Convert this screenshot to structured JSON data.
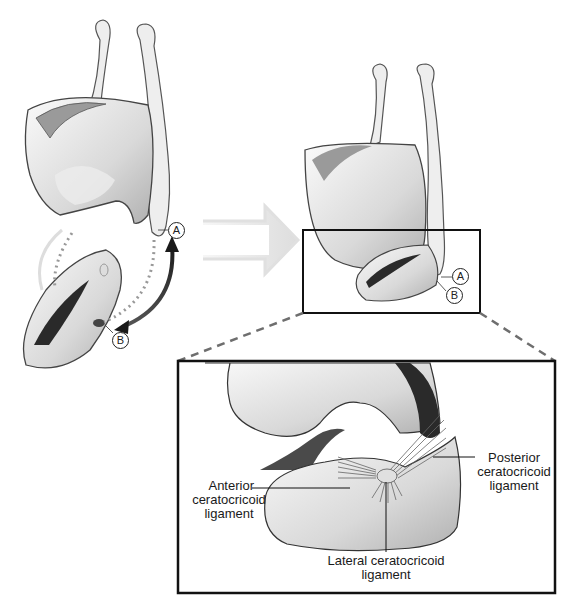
{
  "diagram": {
    "type": "anatomical illustration",
    "left_figure": {
      "markers": [
        {
          "id": "A",
          "label": "A"
        },
        {
          "id": "B",
          "label": "B"
        }
      ]
    },
    "middle_arrow": {
      "direction": "right"
    },
    "right_figure": {
      "markers": [
        {
          "id": "A",
          "label": "A"
        },
        {
          "id": "B",
          "label": "B"
        }
      ]
    },
    "inset": {
      "labels": {
        "anterior": "Anterior\nceratocricoid\nligament",
        "anterior_lines": [
          "Anterior",
          "ceratocricoid",
          "ligament"
        ],
        "posterior_lines": [
          "Posterior",
          "ceratocricoid",
          "ligament"
        ],
        "lateral_lines": [
          "Lateral ceratocricoid",
          "ligament"
        ]
      }
    }
  },
  "colors": {
    "outline": "#1a1a1a",
    "bone_light": "#f2f2f2",
    "bone_mid": "#cfcfcf",
    "bone_dark": "#8a8a8a",
    "arrow_light": "#e6e6e6",
    "dash": "#6e6e6e",
    "curve_dark": "#333333"
  }
}
